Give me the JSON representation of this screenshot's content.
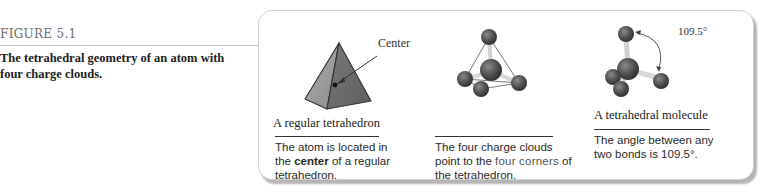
{
  "figure": {
    "label": "FIGURE 5.1",
    "caption": "The tetrahedral geometry of an atom with four charge clouds."
  },
  "panels": [
    {
      "title": "A regular tetrahedron",
      "callout": "Center",
      "description": {
        "before": "The atom is located in the ",
        "emphasis": "center",
        "after": " of a regular tetrahedron."
      }
    },
    {
      "title": "",
      "description": {
        "before": "The four charge clouds point to the ",
        "emphasis": "four corners",
        "after": " of the tetrahedron."
      }
    },
    {
      "title": "A tetrahedral molecule",
      "angle_label": "109.5°",
      "description": {
        "before": "The angle between any two bonds is 109.5°.",
        "emphasis": "",
        "after": ""
      }
    }
  ],
  "colors": {
    "atom": "#555555",
    "bond": "#c8c8c8",
    "pyramid_light": "#9a9a9a",
    "pyramid_dark": "#6e6e6e"
  }
}
